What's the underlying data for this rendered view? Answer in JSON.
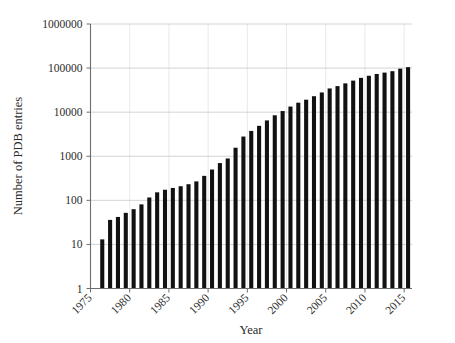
{
  "chart_data": {
    "type": "bar",
    "title": "",
    "subtitle": "",
    "xlabel": "Year",
    "ylabel": "Number of PDB entries",
    "yscale": "log",
    "ylim": [
      1,
      1000000
    ],
    "xlim": [
      1975,
      2016
    ],
    "grid": true,
    "legend": false,
    "legend_position": "none",
    "ytick_labels": [
      "1",
      "10",
      "100",
      "1000",
      "10000",
      "100000",
      "1000000"
    ],
    "ytick_values": [
      1,
      10,
      100,
      1000,
      10000,
      100000,
      1000000
    ],
    "xtick_labels": [
      "1975",
      "1980",
      "1985",
      "1990",
      "1995",
      "2000",
      "2005",
      "2010",
      "2015"
    ],
    "xtick_values": [
      1975,
      1980,
      1985,
      1990,
      1995,
      2000,
      2005,
      2010,
      2015
    ],
    "xtick_rotation": 45,
    "bar_color": "#111111",
    "categories": [
      1976,
      1977,
      1978,
      1979,
      1980,
      1981,
      1982,
      1983,
      1984,
      1985,
      1986,
      1987,
      1988,
      1989,
      1990,
      1991,
      1992,
      1993,
      1994,
      1995,
      1996,
      1997,
      1998,
      1999,
      2000,
      2001,
      2002,
      2003,
      2004,
      2005,
      2006,
      2007,
      2008,
      2009,
      2010,
      2011,
      2012,
      2013,
      2014,
      2015
    ],
    "values": [
      13,
      36,
      42,
      52,
      63,
      81,
      116,
      152,
      174,
      191,
      209,
      232,
      269,
      359,
      500,
      700,
      890,
      1560,
      2800,
      3750,
      4900,
      6500,
      8500,
      10600,
      13400,
      16400,
      19200,
      23000,
      28000,
      34500,
      39000,
      45000,
      52000,
      60000,
      67000,
      73500,
      79000,
      85000,
      97000,
      105000
    ],
    "series": [
      {
        "name": "PDB entries",
        "values": [
          13,
          36,
          42,
          52,
          63,
          81,
          116,
          152,
          174,
          191,
          209,
          232,
          269,
          359,
          500,
          700,
          890,
          1560,
          2800,
          3750,
          4900,
          6500,
          8500,
          10600,
          13400,
          16400,
          19200,
          23000,
          28000,
          34500,
          39000,
          45000,
          52000,
          60000,
          67000,
          73500,
          79000,
          85000,
          97000,
          105000
        ]
      }
    ]
  }
}
